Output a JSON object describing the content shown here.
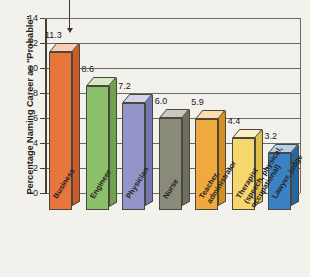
{
  "chart_data": {
    "type": "bar",
    "title": "",
    "subtitle": "",
    "xlabel": "",
    "ylabel": "Percentage Naming Career as \"Probable\"",
    "ylim": [
      0,
      14
    ],
    "ytick_step": 2,
    "yticks": [
      0,
      2,
      4,
      6,
      8,
      10,
      12,
      14
    ],
    "ytick_labels": [
      "0",
      "2",
      "4",
      "6",
      "8",
      "10",
      "12",
      "14"
    ],
    "grid": true,
    "legend": "none",
    "style": "3d-bar",
    "categories": [
      "Business",
      "Engineer",
      "Physician",
      "Nurse",
      "Teacher, administrator",
      "Therapist (speech, physical, occupational)",
      "Lawyer, judge"
    ],
    "category_lines": [
      [
        "Business"
      ],
      [
        "Engineer"
      ],
      [
        "Physician"
      ],
      [
        "Nurse"
      ],
      [
        "Teacher,",
        "administrator"
      ],
      [
        "Therapist",
        "(speech, physical,",
        "occupational)"
      ],
      [
        "Lawyer, judge"
      ]
    ],
    "values": [
      11.3,
      8.6,
      7.2,
      6.0,
      5.9,
      4.4,
      3.2
    ],
    "value_labels": [
      "11.3",
      "8.6",
      "7.2",
      "6.0",
      "5.9",
      "4.4",
      "3.2"
    ],
    "bar_colors": [
      "#e8763c",
      "#8cbf6a",
      "#9395c9",
      "#8a8a7a",
      "#f0a93e",
      "#f5d76e",
      "#3a82c4"
    ],
    "bar_top_colors": [
      "#f6d0b4",
      "#d5e8c3",
      "#d3d4ea",
      "#c9c9bd",
      "#fbddb0",
      "#fbf0c4",
      "#b3d2ea"
    ],
    "bar_side_colors": [
      "#cc5c27",
      "#6fa24d",
      "#7577b3",
      "#6f6f60",
      "#d48f22",
      "#dfbe4c",
      "#24669f"
    ],
    "annotation": {
      "type": "arrow",
      "target_category": "Business",
      "direction": "down"
    }
  }
}
